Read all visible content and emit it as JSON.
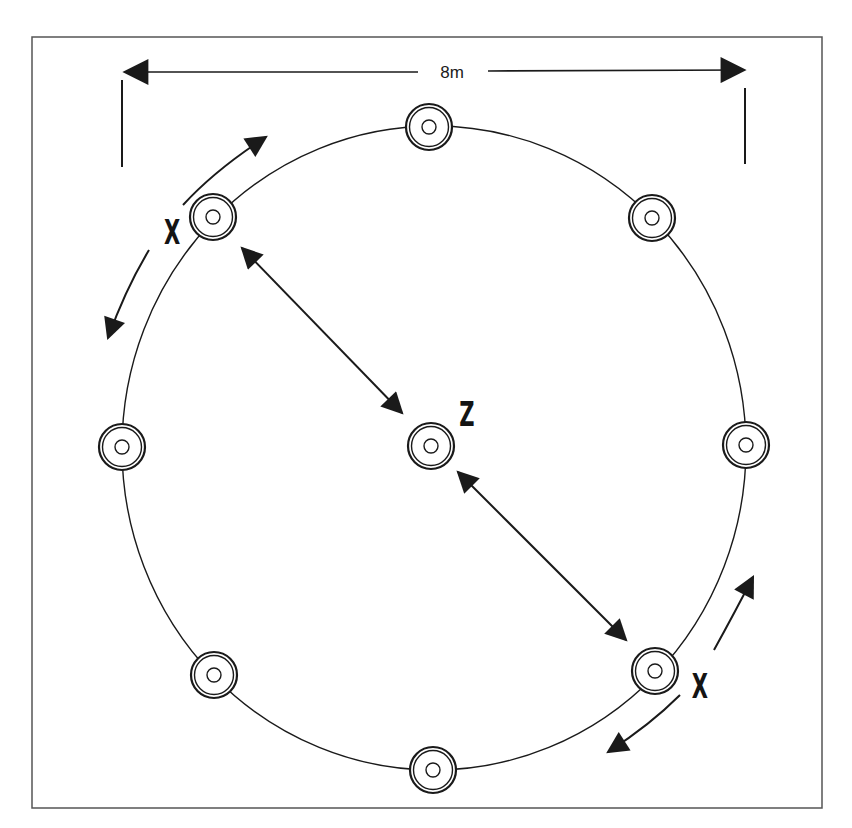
{
  "diagram": {
    "dimension_label": "8m",
    "center_label": "Z",
    "outer_player_label": "X",
    "colors": {
      "ink": "#1a1a1a",
      "background": "#ffffff",
      "frame": "#555555"
    },
    "frame": {
      "x": 32,
      "y": 37,
      "width": 790,
      "height": 771
    },
    "circle": {
      "cx": 434,
      "cy": 448,
      "rx": 312,
      "ry": 322
    },
    "cones": [
      {
        "id": "top",
        "x": 429,
        "y": 127
      },
      {
        "id": "top-left",
        "x": 213,
        "y": 217
      },
      {
        "id": "top-right",
        "x": 652,
        "y": 218
      },
      {
        "id": "left",
        "x": 122,
        "y": 447
      },
      {
        "id": "center",
        "x": 431,
        "y": 446
      },
      {
        "id": "right",
        "x": 746,
        "y": 445
      },
      {
        "id": "bottom-left",
        "x": 214,
        "y": 675
      },
      {
        "id": "bottom-right",
        "x": 655,
        "y": 671
      },
      {
        "id": "bottom",
        "x": 433,
        "y": 770
      }
    ],
    "players": [
      {
        "label": "X",
        "position": "top-left",
        "x": 172,
        "y": 226
      },
      {
        "label": "X",
        "position": "bottom-right",
        "x": 700,
        "y": 678
      },
      {
        "label": "Z",
        "position": "center",
        "x": 467,
        "y": 403
      }
    ]
  }
}
